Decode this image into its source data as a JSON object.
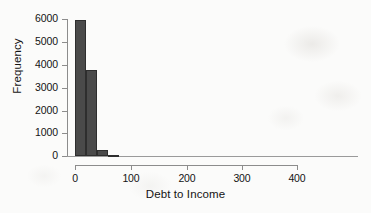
{
  "chart_data": {
    "type": "bar",
    "title": "",
    "subtitle": "",
    "xlabel": "Debt to Income",
    "ylabel": "Frequency",
    "xlim": [
      0,
      420
    ],
    "ylim": [
      0,
      6000
    ],
    "grid": false,
    "legend": null,
    "bin_width": 20,
    "bar_color": "#4a4a4a",
    "bar_edge_color": "#2e2e2e",
    "axis_color": "#8c8c8c",
    "background_color": "#fbfbfa",
    "x_ticks": [
      0,
      100,
      200,
      300,
      400
    ],
    "x_tick_labels": [
      "0",
      "100",
      "200",
      "300",
      "400"
    ],
    "y_ticks": [
      0,
      1000,
      2000,
      3000,
      4000,
      5000,
      6000
    ],
    "y_tick_labels": [
      "0",
      "1000",
      "2000",
      "3000",
      "4000",
      "5000",
      "6000"
    ],
    "bins": [
      {
        "x0": 0,
        "x1": 20,
        "value": 5950
      },
      {
        "x0": 20,
        "x1": 40,
        "value": 3750
      },
      {
        "x0": 40,
        "x1": 60,
        "value": 250
      },
      {
        "x0": 60,
        "x1": 80,
        "value": 60
      }
    ],
    "categories": [
      "0-20",
      "20-40",
      "40-60",
      "60-80"
    ],
    "values": [
      5950,
      3750,
      250,
      60
    ],
    "annotations": []
  },
  "axis": {
    "x_title": "Debt to Income",
    "y_title": "Frequency"
  }
}
